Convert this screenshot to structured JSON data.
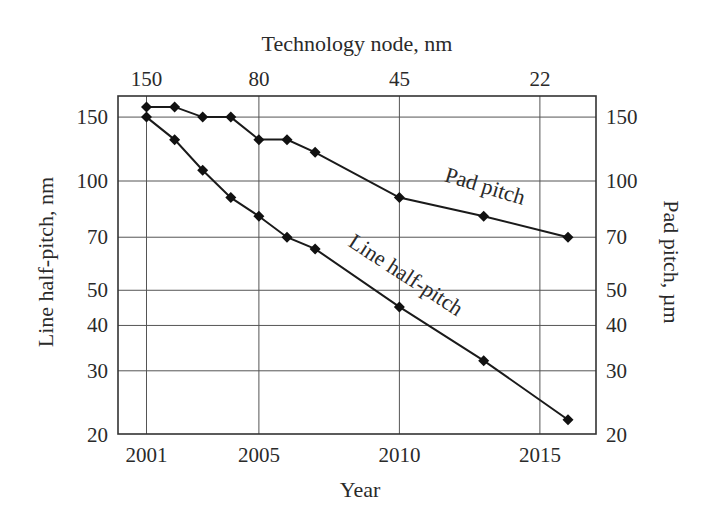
{
  "chart_data": {
    "type": "line",
    "title": "",
    "xlabel": "Year",
    "ylabel": "Line half-pitch, nm",
    "y2label": "Pad pitch, µm",
    "top_xlabel": "Technology node, nm",
    "yscale": "log",
    "ylim": [
      20,
      170
    ],
    "xlim": [
      2000,
      2017
    ],
    "grid": true,
    "legend": "inline labels on curves",
    "x_ticks": [
      2001,
      2005,
      2010,
      2015
    ],
    "x_tick_labels": [
      "2001",
      "2005",
      "2010",
      "2015"
    ],
    "y_ticks": [
      20,
      30,
      40,
      50,
      70,
      100,
      150
    ],
    "y_tick_labels": [
      "20",
      "30",
      "40",
      "50",
      "70",
      "100",
      "150"
    ],
    "y2_ticks": [
      20,
      30,
      40,
      50,
      70,
      100,
      150
    ],
    "y2_tick_labels": [
      "20",
      "30",
      "40",
      "50",
      "70",
      "100",
      "150"
    ],
    "top_ticks_at_year": [
      2001,
      2005,
      2010,
      2015
    ],
    "top_tick_labels": [
      "150",
      "80",
      "45",
      "22"
    ],
    "series": [
      {
        "name": "Pad pitch",
        "axis": "right",
        "unit": "µm",
        "x": [
          2001,
          2002,
          2003,
          2004,
          2005,
          2006,
          2007,
          2010,
          2013,
          2016
        ],
        "values": [
          160,
          160,
          150,
          150,
          130,
          130,
          120,
          90,
          80,
          70
        ]
      },
      {
        "name": "Line half-pitch",
        "axis": "left",
        "unit": "nm",
        "x": [
          2001,
          2002,
          2003,
          2004,
          2005,
          2006,
          2007,
          2010,
          2013,
          2016
        ],
        "values": [
          150,
          130,
          107,
          90,
          80,
          70,
          65,
          45,
          32,
          22
        ]
      }
    ],
    "annotations": [
      {
        "text": "Pad pitch",
        "x": 483,
        "y": 193,
        "angle": 17
      },
      {
        "text": "Line half-pitch",
        "x": 402,
        "y": 281,
        "angle": 33
      }
    ]
  }
}
